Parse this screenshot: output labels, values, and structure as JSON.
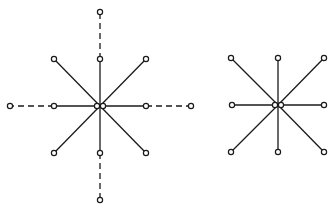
{
  "diagram": {
    "type": "star-graphs",
    "colors": {
      "stroke": "#1a1a1a",
      "background": "#ffffff",
      "node_fill": "#ffffff"
    },
    "node_radius": 2.6,
    "graphs": [
      {
        "id": "left-star",
        "center": [
          100,
          106
        ],
        "center_nodes": [
          [
            97,
            106
          ],
          [
            103,
            106
          ]
        ],
        "solid_spokes": [
          [
            54,
            59
          ],
          [
            100,
            59
          ],
          [
            146,
            59
          ],
          [
            54,
            106
          ],
          [
            146,
            106
          ],
          [
            54,
            153
          ],
          [
            100,
            153
          ],
          [
            146,
            153
          ]
        ],
        "dashed_extensions": [
          {
            "from": [
              100,
              59
            ],
            "to": [
              100,
              12
            ]
          },
          {
            "from": [
              54,
              106
            ],
            "to": [
              10,
              106
            ]
          },
          {
            "from": [
              146,
              106
            ],
            "to": [
              191,
              106
            ]
          },
          {
            "from": [
              100,
              153
            ],
            "to": [
              100,
              200
            ]
          }
        ]
      },
      {
        "id": "right-star",
        "center": [
          278,
          105
        ],
        "center_nodes": [
          [
            275,
            105
          ],
          [
            281,
            105
          ]
        ],
        "solid_spokes": [
          [
            231,
            58
          ],
          [
            278,
            58
          ],
          [
            324,
            58
          ],
          [
            232,
            105
          ],
          [
            324,
            105
          ],
          [
            231,
            152
          ],
          [
            278,
            152
          ],
          [
            324,
            152
          ]
        ],
        "dashed_extensions": []
      }
    ]
  }
}
